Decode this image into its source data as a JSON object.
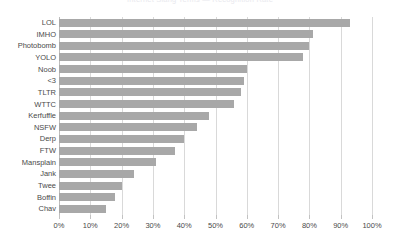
{
  "chart_data": {
    "type": "bar",
    "orientation": "horizontal",
    "title": "Internet Slang Terms — Recognition Rate",
    "xlabel": "",
    "ylabel": "",
    "xlim": [
      0,
      100
    ],
    "xtick_labels": [
      "0%",
      "10%",
      "20%",
      "30%",
      "40%",
      "50%",
      "60%",
      "70%",
      "80%",
      "90%",
      "100%"
    ],
    "xtick_values": [
      0,
      10,
      20,
      30,
      40,
      50,
      60,
      70,
      80,
      90,
      100
    ],
    "grid": true,
    "legend": "none",
    "bar_color": "#a8a8a8",
    "categories": [
      "LOL",
      "IMHO",
      "Photobomb",
      "YOLO",
      "Noob",
      "<3",
      "TLTR",
      "WTTC",
      "Kerfuffle",
      "NSFW",
      "Derp",
      "FTW",
      "Mansplain",
      "Jank",
      "Twee",
      "Boffin",
      "Chav"
    ],
    "values": [
      93,
      81,
      80,
      78,
      60,
      59,
      58,
      56,
      48,
      44,
      40,
      37,
      31,
      24,
      20,
      18,
      15
    ]
  }
}
